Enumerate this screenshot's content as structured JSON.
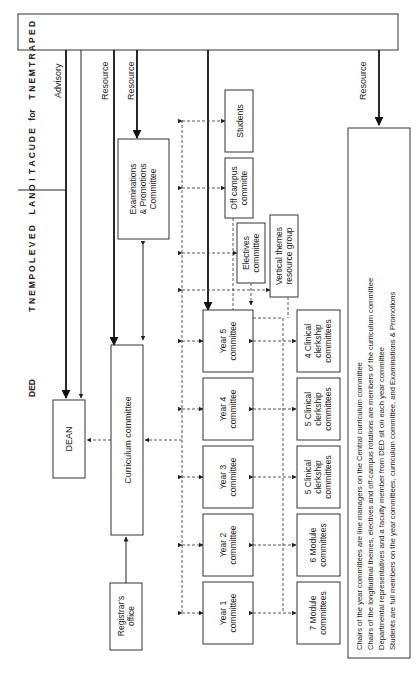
{
  "header": {
    "word1": [
      "D",
      "E",
      "P",
      "A",
      "R",
      "T",
      "M",
      "E",
      "N",
      "T"
    ],
    "word2": "for",
    "word3": [
      "E",
      "D",
      "U",
      "C",
      "A",
      "T",
      "I",
      "O",
      "N",
      "A",
      "L"
    ],
    "word4": [
      "D",
      "E",
      "V",
      "E",
      "L",
      "O",
      "P",
      "M",
      "E",
      "N",
      "T"
    ],
    "abbr": "DED"
  },
  "links": {
    "advisory": "Advisory",
    "resource_1": "Resource",
    "resource_2": "Resource",
    "resource_3": "Resource"
  },
  "nodes": {
    "dean": "DEAN",
    "curriculum": "Curriculum committee",
    "registrar": [
      "Registrar's",
      "office"
    ],
    "exams": [
      "Examinations",
      "& Promotions",
      "Committee"
    ],
    "students": "Students",
    "off_campus": [
      "Off campus",
      "committe"
    ],
    "electives": [
      "Electives",
      "committee"
    ],
    "vertical_themes": [
      "Vertical themes",
      "resource group"
    ],
    "years": [
      [
        "Year 5",
        "committee"
      ],
      [
        "Year 4",
        "committee"
      ],
      [
        "Year 3",
        "committee"
      ],
      [
        "Year 2",
        "committee"
      ],
      [
        "Year 1",
        "committee"
      ]
    ],
    "sub_committees": [
      [
        "4 Clinical",
        "clerkship",
        "committees"
      ],
      [
        "5 Clinical",
        "clerkship",
        "committees"
      ],
      [
        "5 Clinical",
        "clerkship",
        "committees"
      ],
      [
        "6 Module",
        "committees"
      ],
      [
        "7 Module",
        "committees"
      ]
    ]
  },
  "notes": [
    "Chairs of the year committees are line managers on the Central curriculum committee",
    "Chairs of the longitudinal themes, electives and off-campus rotations are members of the curriculum committee",
    "Departmental representatives and a faculty member from DED sit on each year committee",
    "Students are full members on the year committees, curriculum committee, and Examinations & Promotions"
  ]
}
